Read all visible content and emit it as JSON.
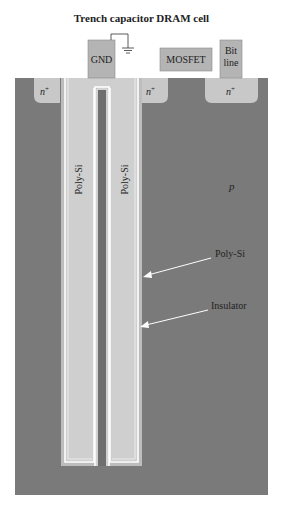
{
  "title": "Trench capacitor DRAM cell",
  "top_blocks": {
    "gnd": "GND",
    "mosfet": "MOSFET",
    "bitline_1": "Bit",
    "bitline_2": "line"
  },
  "regions": {
    "n_plus_left": "n",
    "n_plus_mid": "n",
    "n_plus_right": "n",
    "superscript": "+",
    "substrate": "p"
  },
  "trench_labels": {
    "left": "Poly-Si",
    "right": "Poly-Si"
  },
  "callouts": {
    "polysi": "Poly-Si",
    "insulator": "Insulator"
  },
  "colors": {
    "substrate": "#7a7a7a",
    "n_plus": "#c8c8c8",
    "poly_si": "#cfcfcf",
    "insulator": "#ffffff",
    "block": "#b4b4b4"
  }
}
